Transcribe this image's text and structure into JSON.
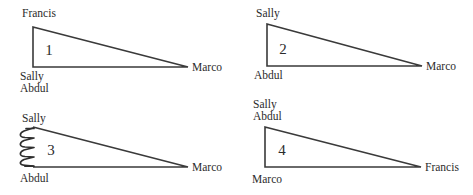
{
  "figure": {
    "background_color": "#ffffff",
    "line_color": "#3a3a3a",
    "text_color": "#2b2b2b",
    "panels": [
      {
        "number": "1",
        "apex_top_label": "Francis",
        "apex_right_label": "Marco",
        "base_left_labels": [
          "Sally",
          "Abdul"
        ],
        "has_spring": false
      },
      {
        "number": "2",
        "apex_top_label": "Sally",
        "apex_right_label": "Marco",
        "base_left_labels": [
          "Abdul"
        ],
        "has_spring": false
      },
      {
        "number": "3",
        "apex_top_label": "Sally",
        "apex_right_label": "Marco",
        "base_left_labels": [
          "Abdul"
        ],
        "has_spring": true
      },
      {
        "number": "4",
        "apex_top_labels": [
          "Sally",
          "Abdul"
        ],
        "apex_right_label": "Francis",
        "base_left_labels": [
          "Marco"
        ],
        "has_spring": false
      }
    ]
  }
}
